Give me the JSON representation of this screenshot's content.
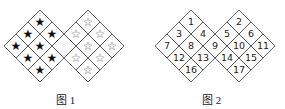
{
  "figure1": {
    "caption": "图 1",
    "left_symbol": "★",
    "right_symbol": "☆",
    "empty_cell": "shared-center"
  },
  "figure2": {
    "caption": "图 2",
    "numbers": [
      "1",
      "2",
      "3",
      "4",
      "5",
      "6",
      "7",
      "8",
      "9",
      "10",
      "11",
      "12",
      "13",
      "14",
      "15",
      "16",
      "17"
    ]
  },
  "colors": {
    "line": "#555555",
    "text": "#222222"
  }
}
